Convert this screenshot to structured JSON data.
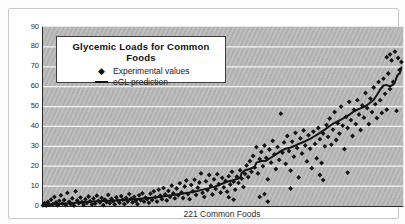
{
  "chart_data": {
    "type": "scatter",
    "title": "Glycemic Loads for Common Foods",
    "xlabel": "221 Common Foods",
    "ylabel": "",
    "xlim": [
      0,
      221
    ],
    "ylim": [
      0,
      90
    ],
    "yticks": [
      0,
      10,
      20,
      30,
      40,
      50,
      60,
      70,
      80,
      90
    ],
    "grid": "horizontal-white-lines",
    "plot_bg": "#b7b7b7",
    "point_color": "#131313",
    "line_color": "#131313",
    "legend": {
      "position": "top-left",
      "entries": [
        {
          "label": "Experimental values",
          "marker": "diamond"
        },
        {
          "label": "eGL prediction",
          "marker": "line"
        }
      ]
    },
    "series": [
      {
        "name": "Experimental values",
        "type": "scatter",
        "marker": "diamond",
        "points": [
          [
            0,
            0.3
          ],
          [
            1,
            1.4
          ],
          [
            2,
            0.2
          ],
          [
            3,
            2.0
          ],
          [
            4,
            0.6
          ],
          [
            5,
            3.2
          ],
          [
            6,
            1.0
          ],
          [
            7,
            4.6
          ],
          [
            8,
            1.8
          ],
          [
            9,
            0.3
          ],
          [
            10,
            2.6
          ],
          [
            11,
            5.4
          ],
          [
            12,
            1.2
          ],
          [
            13,
            3.0
          ],
          [
            14,
            0.5
          ],
          [
            15,
            6.6
          ],
          [
            16,
            2.2
          ],
          [
            17,
            1.0
          ],
          [
            18,
            3.8
          ],
          [
            19,
            0.2
          ],
          [
            20,
            7.4
          ],
          [
            21,
            2.8
          ],
          [
            22,
            1.4
          ],
          [
            23,
            4.2
          ],
          [
            24,
            2.0
          ],
          [
            25,
            0.6
          ],
          [
            26,
            3.4
          ],
          [
            27,
            1.6
          ],
          [
            28,
            4.8
          ],
          [
            29,
            2.4
          ],
          [
            30,
            0.8
          ],
          [
            31,
            3.8
          ],
          [
            32,
            1.2
          ],
          [
            33,
            5.2
          ],
          [
            34,
            2.6
          ],
          [
            35,
            1.8
          ],
          [
            36,
            4.0
          ],
          [
            37,
            0.4
          ],
          [
            38,
            3.2
          ],
          [
            39,
            2.0
          ],
          [
            40,
            5.6
          ],
          [
            41,
            1.4
          ],
          [
            42,
            3.6
          ],
          [
            43,
            2.4
          ],
          [
            44,
            0.8
          ],
          [
            45,
            4.4
          ],
          [
            46,
            2.8
          ],
          [
            47,
            1.6
          ],
          [
            48,
            5.0
          ],
          [
            49,
            3.2
          ],
          [
            50,
            1.0
          ],
          [
            51,
            4.0
          ],
          [
            52,
            2.2
          ],
          [
            53,
            6.0
          ],
          [
            54,
            3.6
          ],
          [
            55,
            1.8
          ],
          [
            56,
            4.6
          ],
          [
            57,
            2.6
          ],
          [
            58,
            0.9
          ],
          [
            59,
            5.4
          ],
          [
            60,
            3.0
          ],
          [
            61,
            6.4
          ],
          [
            62,
            2.2
          ],
          [
            63,
            4.2
          ],
          [
            64,
            3.4
          ],
          [
            65,
            1.6
          ],
          [
            66,
            6.2
          ],
          [
            67,
            3.0
          ],
          [
            68,
            7.4
          ],
          [
            69,
            4.4
          ],
          [
            70,
            2.2
          ],
          [
            71,
            8.2
          ],
          [
            72,
            5.2
          ],
          [
            73,
            3.4
          ],
          [
            74,
            9.0
          ],
          [
            75,
            5.8
          ],
          [
            76,
            2.8
          ],
          [
            77,
            7.6
          ],
          [
            78,
            4.6
          ],
          [
            79,
            10.2
          ],
          [
            80,
            6.4
          ],
          [
            81,
            3.8
          ],
          [
            82,
            8.8
          ],
          [
            83,
            5.4
          ],
          [
            84,
            11.4
          ],
          [
            85,
            6.8
          ],
          [
            86,
            4.0
          ],
          [
            87,
            9.8
          ],
          [
            88,
            12.8
          ],
          [
            89,
            6.0
          ],
          [
            90,
            3.4
          ],
          [
            91,
            10.6
          ],
          [
            92,
            7.4
          ],
          [
            93,
            13.2
          ],
          [
            94,
            5.6
          ],
          [
            95,
            9.2
          ],
          [
            96,
            11.8
          ],
          [
            97,
            16.4
          ],
          [
            98,
            6.6
          ],
          [
            99,
            4.6
          ],
          [
            100,
            12.4
          ],
          [
            101,
            8.0
          ],
          [
            102,
            15.6
          ],
          [
            103,
            10.2
          ],
          [
            104,
            5.8
          ],
          [
            105,
            13.4
          ],
          [
            106,
            8.6
          ],
          [
            107,
            16.0
          ],
          [
            108,
            11.0
          ],
          [
            109,
            6.8
          ],
          [
            110,
            14.2
          ],
          [
            111,
            9.4
          ],
          [
            112,
            12.6
          ],
          [
            113,
            7.2
          ],
          [
            114,
            4.4
          ],
          [
            114,
            15.0
          ],
          [
            115,
            10.8
          ],
          [
            116,
            17.2
          ],
          [
            117,
            3.2
          ],
          [
            117,
            12.2
          ],
          [
            118,
            8.2
          ],
          [
            119,
            14.8
          ],
          [
            120,
            11.6
          ],
          [
            121,
            18.0
          ],
          [
            122,
            13.8
          ],
          [
            123,
            9.6
          ],
          [
            124,
            16.2
          ],
          [
            125,
            20.4
          ],
          [
            126,
            14.6
          ],
          [
            127,
            22.6
          ],
          [
            128,
            17.2
          ],
          [
            129,
            25.2
          ],
          [
            130,
            19.4
          ],
          [
            131,
            29.6
          ],
          [
            132,
            16.4
          ],
          [
            133,
            4.6
          ],
          [
            133,
            23.6
          ],
          [
            134,
            27.2
          ],
          [
            135,
            20.0
          ],
          [
            136,
            6.0
          ],
          [
            136,
            30.4
          ],
          [
            137,
            24.2
          ],
          [
            138,
            2.2
          ],
          [
            138,
            13.4
          ],
          [
            139,
            28.4
          ],
          [
            140,
            21.8
          ],
          [
            141,
            32.8
          ],
          [
            142,
            26.0
          ],
          [
            143,
            18.6
          ],
          [
            144,
            29.6
          ],
          [
            145,
            23.2
          ],
          [
            146,
            46.4
          ],
          [
            147,
            26.8
          ],
          [
            148,
            32.0
          ],
          [
            149,
            21.2
          ],
          [
            150,
            35.2
          ],
          [
            151,
            27.6
          ],
          [
            152,
            8.8
          ],
          [
            152,
            17.8
          ],
          [
            153,
            32.4
          ],
          [
            154,
            24.8
          ],
          [
            155,
            36.8
          ],
          [
            156,
            29.2
          ],
          [
            157,
            14.4
          ],
          [
            158,
            34.0
          ],
          [
            159,
            26.4
          ],
          [
            160,
            38.0
          ],
          [
            161,
            30.4
          ],
          [
            162,
            22.4
          ],
          [
            163,
            35.6
          ],
          [
            164,
            28.8
          ],
          [
            165,
            19.0
          ],
          [
            166,
            37.4
          ],
          [
            167,
            31.2
          ],
          [
            168,
            24.0
          ],
          [
            169,
            39.2
          ],
          [
            170,
            15.6
          ],
          [
            170,
            33.6
          ],
          [
            171,
            21.6
          ],
          [
            172,
            13.0
          ],
          [
            172,
            36.4
          ],
          [
            173,
            30.0
          ],
          [
            174,
            40.8
          ],
          [
            175,
            34.8
          ],
          [
            176,
            44.0
          ],
          [
            177,
            30.8
          ],
          [
            178,
            38.4
          ],
          [
            179,
            47.2
          ],
          [
            180,
            33.2
          ],
          [
            181,
            41.6
          ],
          [
            182,
            36.4
          ],
          [
            183,
            50.0
          ],
          [
            184,
            40.4
          ],
          [
            185,
            28.6
          ],
          [
            186,
            44.8
          ],
          [
            187,
            16.8
          ],
          [
            187,
            39.2
          ],
          [
            188,
            52.4
          ],
          [
            189,
            43.2
          ],
          [
            190,
            35.2
          ],
          [
            191,
            48.4
          ],
          [
            192,
            41.2
          ],
          [
            193,
            53.2
          ],
          [
            194,
            46.0
          ],
          [
            195,
            38.2
          ],
          [
            196,
            50.6
          ],
          [
            197,
            44.4
          ],
          [
            198,
            56.8
          ],
          [
            199,
            49.2
          ],
          [
            200,
            41.2
          ],
          [
            201,
            54.0
          ],
          [
            202,
            47.2
          ],
          [
            203,
            59.6
          ],
          [
            204,
            51.2
          ],
          [
            205,
            44.2
          ],
          [
            206,
            62.4
          ],
          [
            207,
            53.2
          ],
          [
            208,
            46.8
          ],
          [
            209,
            64.0
          ],
          [
            210,
            56.4
          ],
          [
            211,
            48.4
          ],
          [
            211,
            74.8
          ],
          [
            212,
            66.6
          ],
          [
            213,
            58.8
          ],
          [
            213,
            76.2
          ],
          [
            214,
            73.2
          ],
          [
            215,
            62.4
          ],
          [
            216,
            77.6
          ],
          [
            217,
            47.8
          ],
          [
            218,
            74.4
          ],
          [
            219,
            68.4
          ],
          [
            220,
            72.4
          ]
        ]
      },
      {
        "name": "eGL prediction",
        "type": "line",
        "points": [
          [
            0,
            0.4
          ],
          [
            10,
            1.0
          ],
          [
            20,
            1.6
          ],
          [
            30,
            2.2
          ],
          [
            40,
            2.6
          ],
          [
            50,
            3.0
          ],
          [
            60,
            3.6
          ],
          [
            70,
            4.4
          ],
          [
            80,
            5.6
          ],
          [
            85,
            6.2
          ],
          [
            90,
            6.8
          ],
          [
            95,
            7.6
          ],
          [
            100,
            8.6
          ],
          [
            105,
            9.6
          ],
          [
            108,
            10.4
          ],
          [
            110,
            11.2
          ],
          [
            113,
            12.2
          ],
          [
            116,
            12.8
          ],
          [
            119,
            13.6
          ],
          [
            121,
            14.2
          ],
          [
            122,
            16.6
          ],
          [
            124,
            18.0
          ],
          [
            127,
            18.6
          ],
          [
            130,
            19.8
          ],
          [
            131,
            21.8
          ],
          [
            134,
            22.6
          ],
          [
            137,
            22.8
          ],
          [
            140,
            24.4
          ],
          [
            143,
            26.0
          ],
          [
            146,
            27.6
          ],
          [
            149,
            28.8
          ],
          [
            152,
            29.4
          ],
          [
            155,
            30.4
          ],
          [
            158,
            31.6
          ],
          [
            161,
            32.6
          ],
          [
            164,
            33.8
          ],
          [
            167,
            35.2
          ],
          [
            170,
            36.8
          ],
          [
            173,
            38.4
          ],
          [
            176,
            40.2
          ],
          [
            179,
            41.8
          ],
          [
            182,
            43.0
          ],
          [
            185,
            44.4
          ],
          [
            188,
            45.8
          ],
          [
            191,
            47.6
          ],
          [
            194,
            48.8
          ],
          [
            197,
            49.8
          ],
          [
            200,
            51.4
          ],
          [
            203,
            53.4
          ],
          [
            205,
            55.8
          ],
          [
            207,
            58.6
          ],
          [
            209,
            60.6
          ],
          [
            211,
            60.8
          ],
          [
            213,
            60.2
          ],
          [
            215,
            61.0
          ],
          [
            216,
            62.2
          ],
          [
            217,
            64.6
          ],
          [
            218,
            66.2
          ],
          [
            219,
            66.6
          ],
          [
            220,
            69.8
          ]
        ]
      }
    ]
  }
}
